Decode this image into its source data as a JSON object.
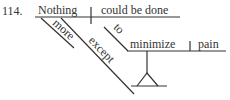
{
  "diagram": {
    "number": "114.",
    "subject": "Nothing",
    "predicate": "could be done",
    "modifiers": {
      "subject_modifier": "more",
      "preposition": "except",
      "infinitive_marker": "to",
      "infinitive_verb": "minimize",
      "infinitive_object": "pain"
    },
    "colors": {
      "line": "#333333",
      "text": "#333333",
      "background": "#ffffff"
    }
  }
}
